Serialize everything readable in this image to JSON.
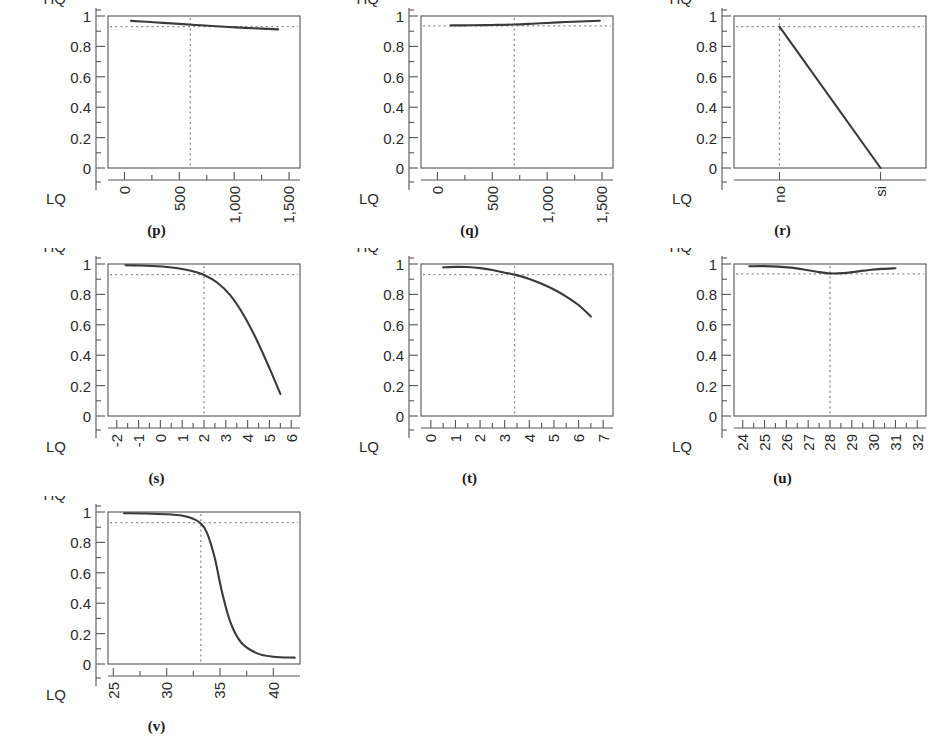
{
  "figure": {
    "axis_top_label": "HQ",
    "axis_bottom_label": "LQ",
    "y_ticks": [
      "1",
      "0.8",
      "0.6",
      "0.4",
      "0.2",
      "0"
    ],
    "y_values": [
      1,
      0.8,
      0.6,
      0.4,
      0.2,
      0
    ],
    "reference_line_value": 0.93,
    "curve_color": "#3a3a3a",
    "reference_color": "#8c8c8c",
    "frame_color": "#555555",
    "background_color": "#ffffff"
  },
  "chart_data": [
    {
      "type": "line",
      "panel": "(p)",
      "title": "",
      "xlabel": "",
      "ylabel": "HQ / LQ",
      "xlim": [
        -150,
        1600
      ],
      "ylim": [
        0,
        1
      ],
      "grid": false,
      "legend": "none",
      "x_tick_labels": [
        "0",
        "500",
        "1,000",
        "1,500"
      ],
      "x_tick_values": [
        0,
        500,
        1000,
        1500
      ],
      "x_minor_count": 1,
      "hline": 0.93,
      "vline": 600,
      "x": [
        60,
        200,
        350,
        500,
        650,
        800,
        950,
        1100,
        1250,
        1400
      ],
      "y": [
        0.968,
        0.962,
        0.955,
        0.948,
        0.941,
        0.934,
        0.928,
        0.922,
        0.917,
        0.912
      ]
    },
    {
      "type": "line",
      "panel": "(q)",
      "title": "",
      "xlabel": "",
      "ylabel": "HQ / LQ",
      "xlim": [
        -150,
        1600
      ],
      "ylim": [
        0,
        1
      ],
      "grid": false,
      "legend": "none",
      "x_tick_labels": [
        "0",
        "500",
        "1,000",
        "1,500"
      ],
      "x_tick_values": [
        0,
        500,
        1000,
        1500
      ],
      "x_minor_count": 1,
      "hline": 0.935,
      "vline": 700,
      "x": [
        120,
        300,
        500,
        700,
        900,
        1100,
        1300,
        1480
      ],
      "y": [
        0.938,
        0.939,
        0.941,
        0.944,
        0.951,
        0.958,
        0.964,
        0.969
      ]
    },
    {
      "type": "line",
      "panel": "(r)",
      "title": "",
      "xlabel": "",
      "ylabel": "HQ / LQ",
      "categorical": true,
      "ylim": [
        0,
        1
      ],
      "grid": false,
      "legend": "none",
      "x_tick_labels": [
        "no",
        "si"
      ],
      "x_tick_values": [
        0,
        1
      ],
      "x_minor_count": 0,
      "hline": 0.93,
      "vline": 0,
      "x": [
        0,
        1
      ],
      "y": [
        0.93,
        0.0
      ]
    },
    {
      "type": "line",
      "panel": "(s)",
      "title": "",
      "xlabel": "",
      "ylabel": "HQ / LQ",
      "xlim": [
        -2.4,
        6.4
      ],
      "ylim": [
        0,
        1
      ],
      "grid": false,
      "legend": "none",
      "x_tick_labels": [
        "-2",
        "-1",
        "0",
        "1",
        "2",
        "3",
        "4",
        "5",
        "6"
      ],
      "x_tick_values": [
        -2,
        -1,
        0,
        1,
        2,
        3,
        4,
        5,
        6
      ],
      "x_minor_count": 1,
      "hline": 0.93,
      "vline": 2,
      "x": [
        -1.6,
        -1.0,
        -0.4,
        0.2,
        0.8,
        1.4,
        2.0,
        2.6,
        3.2,
        3.8,
        4.4,
        5.0,
        5.5
      ],
      "y": [
        0.992,
        0.99,
        0.987,
        0.982,
        0.972,
        0.955,
        0.928,
        0.878,
        0.795,
        0.668,
        0.505,
        0.315,
        0.145
      ]
    },
    {
      "type": "line",
      "panel": "(t)",
      "title": "",
      "xlabel": "",
      "ylabel": "HQ / LQ",
      "xlim": [
        -0.4,
        7.4
      ],
      "ylim": [
        0,
        1
      ],
      "grid": false,
      "legend": "none",
      "x_tick_labels": [
        "0",
        "1",
        "2",
        "3",
        "4",
        "5",
        "6",
        "7"
      ],
      "x_tick_values": [
        0,
        1,
        2,
        3,
        4,
        5,
        6,
        7
      ],
      "x_minor_count": 1,
      "hline": 0.93,
      "vline": 3.4,
      "x": [
        0.5,
        1.0,
        1.5,
        2.0,
        2.5,
        3.0,
        3.4,
        4.0,
        4.5,
        5.0,
        5.5,
        6.0,
        6.5
      ],
      "y": [
        0.978,
        0.981,
        0.98,
        0.973,
        0.96,
        0.943,
        0.93,
        0.902,
        0.87,
        0.832,
        0.786,
        0.73,
        0.655
      ]
    },
    {
      "type": "line",
      "panel": "(u)",
      "title": "",
      "xlabel": "",
      "ylabel": "HQ / LQ",
      "xlim": [
        23.6,
        32.4
      ],
      "ylim": [
        0,
        1
      ],
      "grid": false,
      "legend": "none",
      "x_tick_labels": [
        "24",
        "25",
        "26",
        "27",
        "28",
        "29",
        "30",
        "31",
        "32"
      ],
      "x_tick_values": [
        24,
        25,
        26,
        27,
        28,
        29,
        30,
        31,
        32
      ],
      "x_minor_count": 1,
      "hline": 0.935,
      "vline": 28,
      "x": [
        24.3,
        25.0,
        25.6,
        26.2,
        26.8,
        27.4,
        28.0,
        28.6,
        29.2,
        29.8,
        30.4,
        31.0
      ],
      "y": [
        0.985,
        0.986,
        0.983,
        0.976,
        0.964,
        0.949,
        0.938,
        0.94,
        0.95,
        0.961,
        0.968,
        0.972
      ]
    },
    {
      "type": "line",
      "panel": "(v)",
      "title": "",
      "xlabel": "",
      "ylabel": "HQ / LQ",
      "xlim": [
        24.5,
        42.5
      ],
      "ylim": [
        0,
        1
      ],
      "grid": false,
      "legend": "none",
      "x_tick_labels": [
        "25",
        "30",
        "35",
        "40"
      ],
      "x_tick_values": [
        25,
        30,
        35,
        40
      ],
      "x_minor_count": 1,
      "hline": 0.93,
      "vline": 33.2,
      "x": [
        26.0,
        28.0,
        30.0,
        31.5,
        32.5,
        33.2,
        33.8,
        34.5,
        35.2,
        36.0,
        37.0,
        38.5,
        40.0,
        42.0
      ],
      "y": [
        0.992,
        0.99,
        0.985,
        0.975,
        0.955,
        0.925,
        0.86,
        0.7,
        0.47,
        0.27,
        0.14,
        0.07,
        0.048,
        0.042
      ]
    }
  ]
}
